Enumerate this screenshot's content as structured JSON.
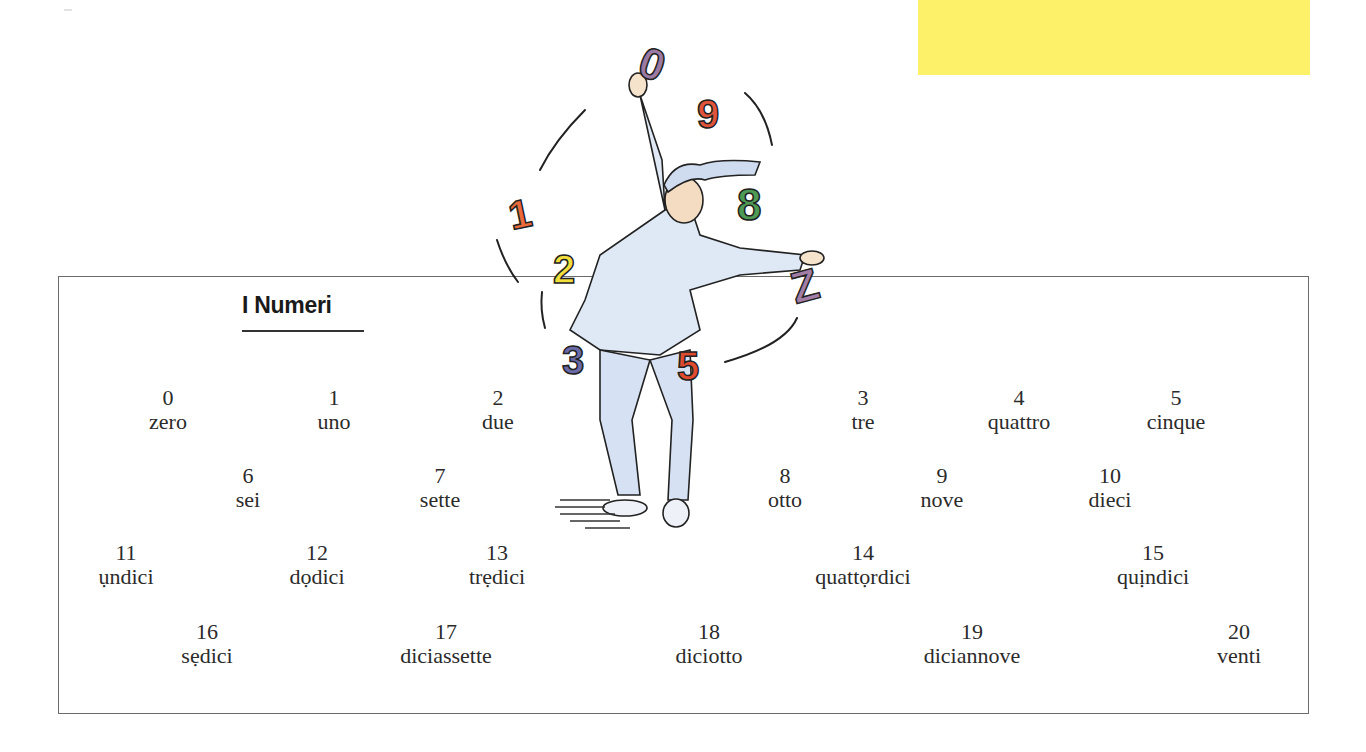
{
  "page": {
    "title": "I Numeri",
    "accent_color": "#fdf16a"
  },
  "illustration": {
    "description": "Pierrot-style jester juggling colored numerals",
    "juggled_numerals": [
      "0",
      "9",
      "8",
      "7",
      "1",
      "2",
      "3",
      "5"
    ]
  },
  "numbers": [
    {
      "digit": "0",
      "word": "zero"
    },
    {
      "digit": "1",
      "word": "uno"
    },
    {
      "digit": "2",
      "word": "due"
    },
    {
      "digit": "3",
      "word": "tre"
    },
    {
      "digit": "4",
      "word": "quattro"
    },
    {
      "digit": "5",
      "word": "cinque"
    },
    {
      "digit": "6",
      "word": "sei"
    },
    {
      "digit": "7",
      "word": "sette"
    },
    {
      "digit": "8",
      "word": "otto"
    },
    {
      "digit": "9",
      "word": "nove"
    },
    {
      "digit": "10",
      "word": "dieci"
    },
    {
      "digit": "11",
      "word": "ụndici"
    },
    {
      "digit": "12",
      "word": "dọdici"
    },
    {
      "digit": "13",
      "word": "trẹdici"
    },
    {
      "digit": "14",
      "word": "quattọrdici"
    },
    {
      "digit": "15",
      "word": "quịndici"
    },
    {
      "digit": "16",
      "word": "sẹdici"
    },
    {
      "digit": "17",
      "word": "diciassette"
    },
    {
      "digit": "18",
      "word": "diciotto"
    },
    {
      "digit": "19",
      "word": "diciannove"
    },
    {
      "digit": "20",
      "word": "venti"
    }
  ]
}
